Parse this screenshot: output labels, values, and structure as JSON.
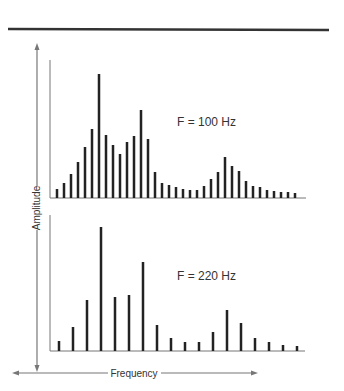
{
  "colors": {
    "bar": "#222222",
    "axis": "#777777",
    "rule": "#333333",
    "text": "#333333"
  },
  "chart_data": [
    {
      "type": "bar",
      "title": "F = 100 Hz",
      "xlabel": "Frequency",
      "ylabel": "Amplitude",
      "grid": false,
      "harmonic_spacing": 1,
      "values": [
        9,
        15,
        24,
        36,
        51,
        69,
        124,
        63,
        53,
        44,
        56,
        62,
        88,
        59,
        26,
        15,
        13,
        11,
        9,
        8,
        8,
        12,
        19,
        26,
        41,
        32,
        27,
        17,
        12,
        11,
        8,
        7,
        6,
        6,
        5
      ],
      "ylim": [
        0,
        138
      ]
    },
    {
      "type": "bar",
      "title": "F = 220 Hz",
      "xlabel": "Frequency",
      "ylabel": "Amplitude",
      "grid": false,
      "harmonic_spacing": 2,
      "values": [
        10,
        24,
        51,
        124,
        54,
        56,
        89,
        26,
        13,
        9,
        9,
        19,
        41,
        28,
        13,
        9,
        6,
        5
      ],
      "ylim": [
        0,
        136
      ]
    }
  ],
  "axes": {
    "ylabel": "Amplitude",
    "xlabel": "Frequency"
  }
}
